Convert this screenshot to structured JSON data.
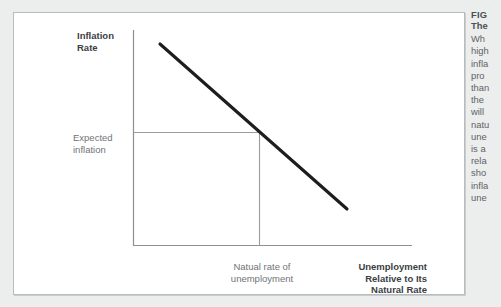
{
  "figure": {
    "card_name": "phillips-curve-figure"
  },
  "chart_data": {
    "type": "line",
    "title": "",
    "xlabel": "Unemployment Relative to Its Natural Rate",
    "ylabel": "Inflation Rate",
    "axis_labels": {
      "y_axis": "Inflation\nRate",
      "x_axis": "Unemployment\nRelative to Its\nNatural Rate"
    },
    "annotations": [
      {
        "name": "expected-inflation",
        "text": "Expected\ninflation",
        "axis": "y"
      },
      {
        "name": "natural-rate",
        "text": "Natual rate of\nunemployment",
        "axis": "x"
      }
    ],
    "series": [
      {
        "name": "short-run-phillips-curve",
        "points": [
          {
            "x": 0.12,
            "y": 0.95
          },
          {
            "x": 0.78,
            "y": 0.17
          }
        ],
        "color": "#1d1d1b",
        "style": "solid",
        "width": 3.1
      }
    ],
    "guides": [
      {
        "name": "expected-inflation-guide",
        "orientation": "horizontal",
        "from": {
          "x": 0.0,
          "y": 0.535
        },
        "to": {
          "x": 0.455,
          "y": 0.535
        },
        "color": "#9a9d9f"
      },
      {
        "name": "natural-rate-guide",
        "orientation": "vertical",
        "from": {
          "x": 0.455,
          "y": 0.535
        },
        "to": {
          "x": 0.455,
          "y": 0.0
        },
        "color": "#9a9d9f"
      }
    ],
    "axis_ranges": {
      "xlim": [
        0,
        1
      ],
      "ylim": [
        0,
        1
      ]
    },
    "grid": false,
    "legend": "none",
    "axis_color": "#8e9194"
  },
  "caption": {
    "heading": "FIG",
    "subheading": "The",
    "body_lines": [
      "Wh",
      "high",
      "infla",
      "pro",
      "than",
      "the",
      "will",
      "natu",
      "une",
      "is a",
      "rela",
      "sho",
      "infla",
      "une"
    ]
  },
  "colors": {
    "page_background": "#eceded",
    "card_background": "#ffffff",
    "card_border": "#b9bcbe",
    "curve": "#1d1d1b",
    "axis": "#8e9194",
    "guide": "#9a9d9f",
    "label_text": "#6f7477",
    "bold_text": "#3b3f42",
    "caption_text": "#5d6366"
  }
}
